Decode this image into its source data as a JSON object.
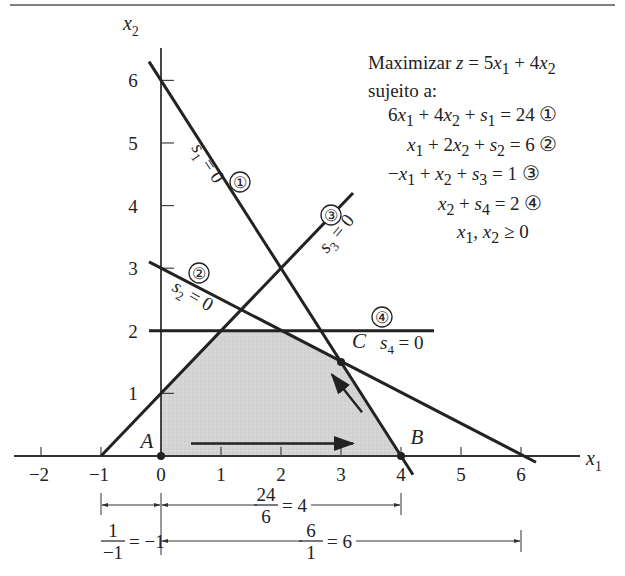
{
  "chart_data": {
    "type": "line",
    "title": "",
    "xlabel": "x1",
    "ylabel": "x2",
    "xlim": [
      -2.4,
      6.6
    ],
    "ylim": [
      0,
      6.6
    ],
    "x_ticks": [
      -2,
      -1,
      0,
      1,
      2,
      3,
      4,
      5,
      6
    ],
    "y_ticks": [
      1,
      2,
      3,
      4,
      5,
      6
    ],
    "grid": false,
    "objective": "Maximizar z = 5x1 + 4x2",
    "subject_to_label": "sujeito a:",
    "constraints": [
      {
        "id": 1,
        "equation": "6x1 + 4x2 + s1 = 24",
        "line_label": "s1 = 0",
        "a": 6,
        "b": 4,
        "rhs": 24,
        "segment": [
          [
            -0.2,
            6.3
          ],
          [
            4.2,
            -0.3
          ]
        ]
      },
      {
        "id": 2,
        "equation": "x1 + 2x2 + s2 = 6",
        "line_label": "s2 = 0",
        "a": 1,
        "b": 2,
        "rhs": 6,
        "segment": [
          [
            -0.2,
            3.1
          ],
          [
            6.25,
            -0.1
          ]
        ]
      },
      {
        "id": 3,
        "equation": "-x1 + x2 + s3 = 1",
        "line_label": "s3 = 0",
        "a": -1,
        "b": 1,
        "rhs": 1,
        "segment": [
          [
            -1,
            0
          ],
          [
            3.2,
            4.2
          ]
        ]
      },
      {
        "id": 4,
        "equation": "x2 + s4 = 2",
        "line_label": "s4 = 0",
        "a": 0,
        "b": 1,
        "rhs": 2,
        "segment": [
          [
            -0.2,
            2
          ],
          [
            4.55,
            2
          ]
        ]
      }
    ],
    "nonnegativity": "x1, x2 ≥ 0",
    "feasible_region": [
      [
        0,
        0
      ],
      [
        4,
        0
      ],
      [
        3,
        1.5
      ],
      [
        2,
        2
      ],
      [
        1,
        2
      ],
      [
        0,
        1
      ]
    ],
    "points": [
      {
        "label": "A",
        "x": 0,
        "y": 0
      },
      {
        "label": "B",
        "x": 4,
        "y": 0
      },
      {
        "label": "C",
        "x": 3,
        "y": 1.5
      }
    ],
    "arrows": [
      {
        "from": [
          0.5,
          0.2
        ],
        "to": [
          3.2,
          0.2
        ]
      },
      {
        "from": [
          3.35,
          0.7
        ],
        "to": [
          2.85,
          1.3
        ]
      }
    ],
    "ratio_annotations": [
      {
        "text_num": "24",
        "text_den": "6",
        "result": "= 4",
        "from": 0,
        "to": 4
      },
      {
        "text_num": "1",
        "text_den": "−1",
        "result": "= −1",
        "from": -1,
        "to": 0
      },
      {
        "text_num": "6",
        "text_den": "1",
        "result": "= 6",
        "from": 0,
        "to": 6
      }
    ]
  },
  "text": {
    "x1_label": "x",
    "x1_sub": "1",
    "x2_label": "x",
    "x2_sub": "2",
    "circled": [
      "①",
      "②",
      "③",
      "④"
    ]
  }
}
